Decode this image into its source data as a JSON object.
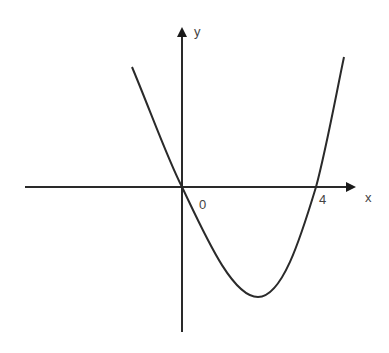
{
  "diagram": {
    "type": "function-graph",
    "axes": {
      "x_label": "x",
      "y_label": "y"
    },
    "tick_labels": {
      "origin": "0",
      "root": "4"
    },
    "colors": {
      "stroke": "#2a2a2a",
      "background": "#ffffff"
    }
  }
}
